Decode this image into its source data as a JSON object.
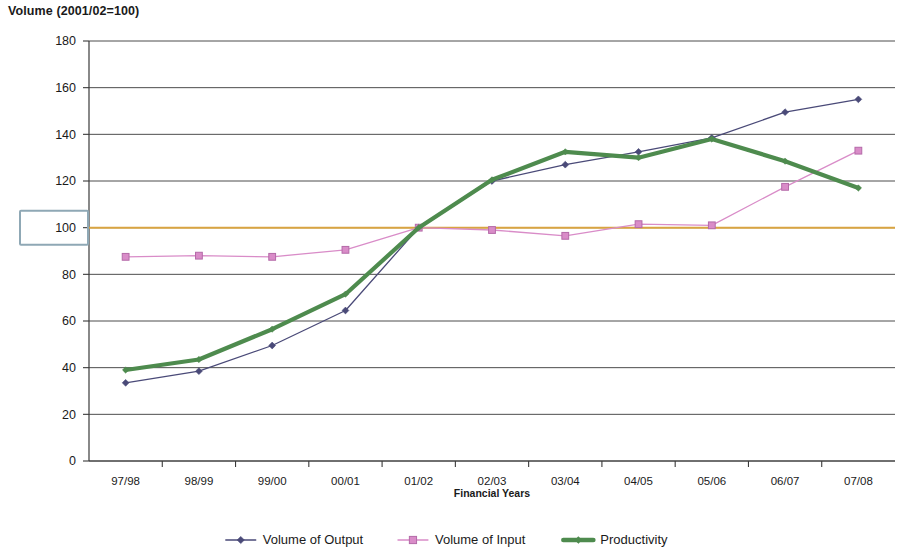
{
  "chart": {
    "title": "Volume (2001/02=100)",
    "xlabel": "Financial Years",
    "highlighted_ytick": "100"
  },
  "axis": {
    "yticks": [
      "180",
      "160",
      "140",
      "120",
      "100",
      "80",
      "60",
      "40",
      "20",
      "0"
    ]
  },
  "legend": {
    "items": [
      {
        "label": "Volume of Output",
        "marker": "diamond-marker",
        "color": "#4a4a78"
      },
      {
        "label": "Volume of Input",
        "marker": "square-marker",
        "color": "#d98cc8"
      },
      {
        "label": "Productivity",
        "marker": "thick-line-marker",
        "color": "#4e8b4e"
      }
    ]
  },
  "colors": {
    "output": "#4a4a78",
    "input": "#d98cc8",
    "productivity": "#4e8b4e",
    "baseline": "#d9a441",
    "grid": "#4d4d4d",
    "highlight": "#8fa8b5"
  },
  "chart_data": {
    "type": "line",
    "title": "Volume (2001/02=100)",
    "xlabel": "Financial Years",
    "ylabel": "Volume (2001/02=100)",
    "categories": [
      "97/98",
      "98/99",
      "99/00",
      "00/01",
      "01/02",
      "02/03",
      "03/04",
      "04/05",
      "05/06",
      "06/07",
      "07/08"
    ],
    "ylim": [
      0,
      180
    ],
    "ytick_step": 20,
    "grid": true,
    "legend_position": "bottom",
    "baseline_value": 100,
    "series": [
      {
        "name": "Volume of Output",
        "color": "#4a4a78",
        "marker": "diamond",
        "values": [
          33.5,
          38.5,
          49.5,
          64.5,
          100,
          120,
          127,
          132.5,
          138.5,
          149.5,
          155
        ]
      },
      {
        "name": "Volume of Input",
        "color": "#d98cc8",
        "marker": "square",
        "values": [
          87.5,
          88,
          87.5,
          90.5,
          100,
          99,
          96.5,
          101.5,
          101,
          117.5,
          133
        ]
      },
      {
        "name": "Productivity",
        "color": "#4e8b4e",
        "marker": "thick-line",
        "values": [
          39,
          43.5,
          56.5,
          71.5,
          100,
          120.5,
          132.5,
          130,
          138,
          128.5,
          117
        ]
      }
    ]
  }
}
